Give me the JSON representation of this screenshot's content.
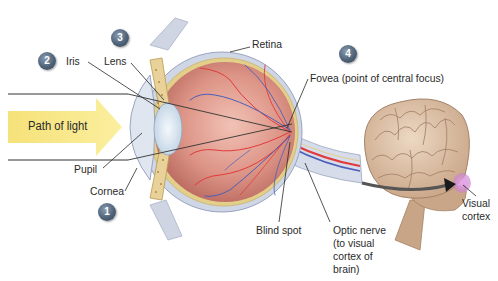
{
  "diagram": {
    "light_path_label": "Path of light",
    "labels": {
      "iris": "Iris",
      "lens": "Lens",
      "retina": "Retina",
      "fovea": "Fovea (point of central focus)",
      "pupil": "Pupil",
      "cornea": "Cornea",
      "blind_spot": "Blind spot",
      "optic_nerve_1": "Optic nerve",
      "optic_nerve_2": "(to visual",
      "optic_nerve_3": "cortex of",
      "optic_nerve_4": "brain)",
      "visual_cortex_1": "Visual",
      "visual_cortex_2": "cortex"
    },
    "badges": {
      "cornea": "1",
      "iris": "2",
      "lens": "3",
      "fovea": "4"
    },
    "colors": {
      "light_arrow": "#f7e98a",
      "eyeball": "#d98a7e",
      "sclera": "#c7cfe0",
      "retina_layer": "#e3cf8a",
      "artery": "#e23a3a",
      "vein": "#4a5fb8",
      "brain": "#d9bfa5",
      "visual_cortex": "#d48fd6",
      "badge": "#4f6378"
    }
  }
}
